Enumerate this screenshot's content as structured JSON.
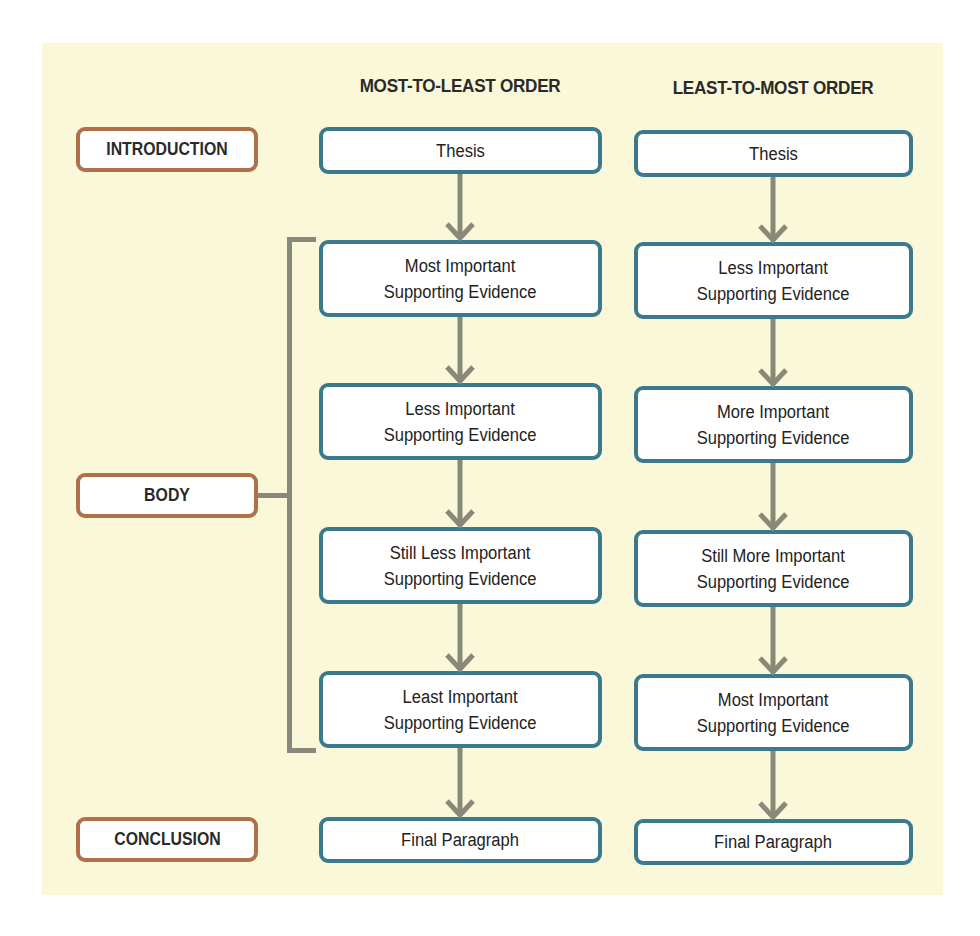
{
  "columns": {
    "left": {
      "title": "MOST-TO-LEAST ORDER",
      "boxes": [
        "Thesis",
        "Most Important\nSupporting Evidence",
        "Less Important\nSupporting Evidence",
        "Still Less Important\nSupporting Evidence",
        "Least Important\nSupporting Evidence",
        "Final Paragraph"
      ]
    },
    "right": {
      "title": "LEAST-TO-MOST ORDER",
      "boxes": [
        "Thesis",
        "Less Important\nSupporting Evidence",
        "More Important\nSupporting Evidence",
        "Still More Important\nSupporting Evidence",
        "Most Important\nSupporting Evidence",
        "Final Paragraph"
      ]
    }
  },
  "sections": {
    "introduction": "INTRODUCTION",
    "body": "BODY",
    "conclusion": "CONCLUSION"
  },
  "colors": {
    "background": "#fbf8d9",
    "box_border": "#3b7a8e",
    "section_border": "#b0704a",
    "connector": "#878a7b"
  }
}
